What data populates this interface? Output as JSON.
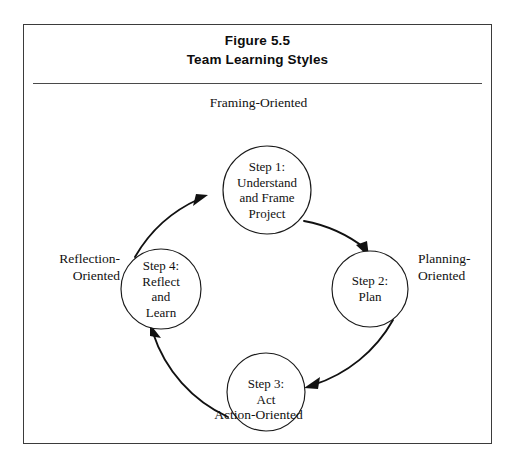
{
  "figure": {
    "number_line": "Figure 5.5",
    "title_line": "Team Learning Styles"
  },
  "diagram": {
    "type": "cycle",
    "nodes": [
      {
        "id": "step1",
        "label": "Step 1:\nUnderstand\nand Frame\nProject",
        "cx": 243,
        "cy": 165,
        "r": 44
      },
      {
        "id": "step2",
        "label": "Step 2:\nPlan",
        "cx": 346,
        "cy": 264,
        "r": 38
      },
      {
        "id": "step3",
        "label": "Step 3:\nAct",
        "cx": 242,
        "cy": 367,
        "r": 39
      },
      {
        "id": "step4",
        "label": "Step 4:\nReflect\nand\nLearn",
        "cx": 137,
        "cy": 264,
        "r": 40
      }
    ],
    "orientation_labels": {
      "top": "Framing-Oriented",
      "right": "Planning-\nOriented",
      "bottom": "Action-Oriented",
      "left": "Reflection-\nOriented"
    },
    "flow_order": [
      "step1",
      "step2",
      "step3",
      "step4",
      "step1"
    ],
    "colors": {
      "stroke": "#111111",
      "circle_stroke": "#1a1a1a",
      "frame_border": "#3b3b3b",
      "background": "#ffffff",
      "text": "#111111"
    }
  }
}
